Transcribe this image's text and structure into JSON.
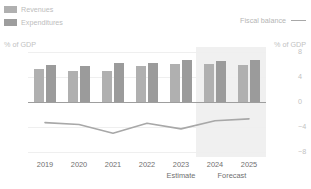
{
  "legend": {
    "revenues_label": "Revenues",
    "expenditures_label": "Expenditures",
    "fiscal_balance_label": "Fiscal balance"
  },
  "axes": {
    "left_title": "% of GDP",
    "right_title": "% of GDP",
    "left_ticks": [
      "40",
      "20",
      "0",
      "−20",
      "−40"
    ],
    "right_ticks": [
      "8",
      "4",
      "0",
      "−4",
      "−8"
    ]
  },
  "periods": {
    "estimate_label": "Estimate",
    "forecast_label": "Forecast"
  },
  "colors": {
    "revenues": "#b0b0b0",
    "expenditures": "#9b9b9b",
    "fiscal_balance_line": "#a8a8a8",
    "forecast_band": "#f0f0f0",
    "zero_axis": "#9e9e9e"
  },
  "chart_data": {
    "type": "bar",
    "title": "",
    "xlabel": "",
    "ylabel": "% of GDP",
    "categories": [
      "2019",
      "2020",
      "2021",
      "2022",
      "2023",
      "2024",
      "2025"
    ],
    "ylim": [
      -40,
      40
    ],
    "y2lim": [
      -8,
      8
    ],
    "yticks": [
      40,
      20,
      0,
      -20,
      -40
    ],
    "y2ticks": [
      8,
      4,
      0,
      -4,
      -8
    ],
    "grid": true,
    "legend_position": "top",
    "estimate_year": "2023",
    "forecast_years": [
      "2024",
      "2025"
    ],
    "series": [
      {
        "name": "Revenues",
        "axis": "left",
        "type": "bar",
        "values": [
          26.5,
          25.0,
          25.0,
          28.5,
          30.5,
          30.5,
          30.0
        ]
      },
      {
        "name": "Expenditures",
        "axis": "left",
        "type": "bar",
        "values": [
          29.5,
          29.0,
          31.5,
          31.5,
          33.5,
          33.0,
          33.5
        ]
      },
      {
        "name": "Fiscal balance",
        "axis": "right",
        "type": "line",
        "values": [
          -3.3,
          -3.6,
          -5.0,
          -3.4,
          -4.3,
          -3.0,
          -2.7
        ]
      }
    ]
  }
}
